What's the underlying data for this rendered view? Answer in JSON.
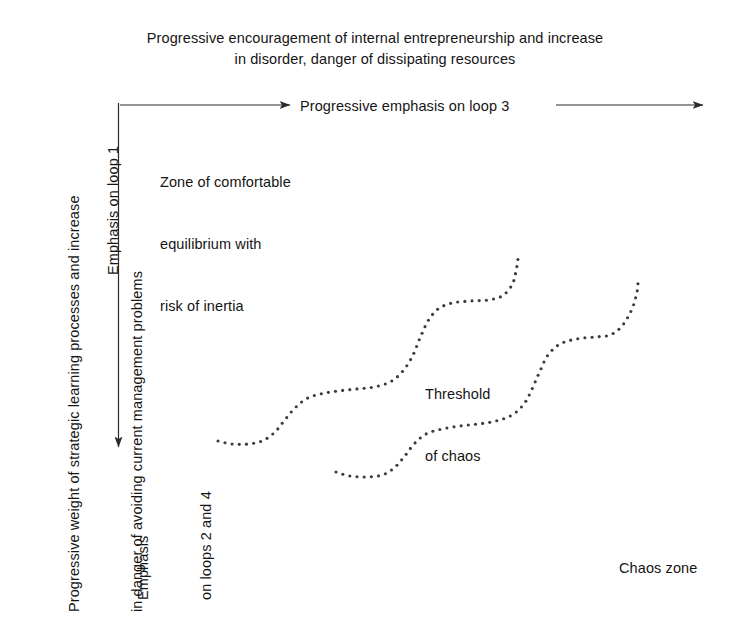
{
  "figure": {
    "title_caption": {
      "line1": "Progressive encouragement of internal entrepreneurship and increase",
      "line2": "in disorder, danger of dissipating resources"
    },
    "horizontal_axis_label": "Progressive emphasis on loop 3",
    "vertical_axis_caption": {
      "line1": "Progressive weight of strategic learning processes and increase",
      "line2": "in danger of avoiding current management problems"
    },
    "vertical_arrow_start_label": "Emphasis on loop 1",
    "vertical_arrow_end_label": {
      "line1": "Emphasis",
      "line2": "on loops 2 and 4"
    },
    "zone_label": {
      "line1": "Zone of comfortable",
      "line2": "equilibrium with",
      "line3": "risk of inertia"
    },
    "threshold_label": {
      "line1": "Threshold",
      "line2": "of chaos"
    },
    "chaos_label": "Chaos zone",
    "colors": {
      "background": "#ffffff",
      "text": "#151515",
      "line": "#2b2b2b",
      "dots": "#3a3a3a"
    }
  },
  "chart_data": {
    "type": "line",
    "title": "Progressive encouragement of internal entrepreneurship and increase in disorder, danger of dissipating resources",
    "xlabel": "Progressive emphasis on loop 3",
    "ylabel": "Progressive weight of strategic learning processes and increase in danger of avoiding current management problems",
    "grid": false,
    "legend": "none",
    "annotations": [
      "Zone of comfortable equilibrium with risk of inertia",
      "Threshold of chaos",
      "Chaos zone",
      "Emphasis on loop 1",
      "Emphasis on loops 2 and 4"
    ],
    "series": [
      {
        "name": "threshold-of-chaos-upper",
        "style": "dotted",
        "points": [
          [
            218,
            441
          ],
          [
            232,
            444
          ],
          [
            248,
            444
          ],
          [
            262,
            441
          ],
          [
            274,
            433
          ],
          [
            284,
            421
          ],
          [
            294,
            409
          ],
          [
            306,
            399
          ],
          [
            320,
            394
          ],
          [
            338,
            391
          ],
          [
            356,
            389
          ],
          [
            374,
            387
          ],
          [
            390,
            382
          ],
          [
            402,
            372
          ],
          [
            412,
            357
          ],
          [
            420,
            338
          ],
          [
            428,
            321
          ],
          [
            438,
            309
          ],
          [
            452,
            303
          ],
          [
            470,
            301
          ],
          [
            488,
            300
          ],
          [
            502,
            296
          ],
          [
            512,
            285
          ],
          [
            516,
            271
          ],
          [
            518,
            259
          ]
        ]
      },
      {
        "name": "threshold-of-chaos-lower",
        "style": "dotted",
        "points": [
          [
            336,
            472
          ],
          [
            350,
            476
          ],
          [
            366,
            477
          ],
          [
            382,
            475
          ],
          [
            394,
            468
          ],
          [
            404,
            457
          ],
          [
            414,
            444
          ],
          [
            426,
            434
          ],
          [
            442,
            429
          ],
          [
            460,
            426
          ],
          [
            478,
            424
          ],
          [
            496,
            421
          ],
          [
            512,
            415
          ],
          [
            524,
            404
          ],
          [
            532,
            389
          ],
          [
            540,
            371
          ],
          [
            548,
            355
          ],
          [
            560,
            344
          ],
          [
            576,
            339
          ],
          [
            594,
            337
          ],
          [
            610,
            335
          ],
          [
            622,
            326
          ],
          [
            632,
            309
          ],
          [
            637,
            292
          ],
          [
            638,
            283
          ]
        ]
      }
    ]
  }
}
